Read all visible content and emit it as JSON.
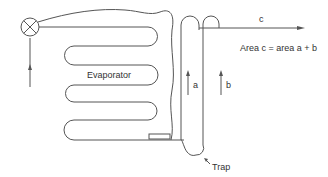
{
  "diagram": {
    "type": "refrigeration-evaporator-schematic",
    "labels": {
      "evaporator": "Evaporator",
      "flow_a": "a",
      "flow_b": "b",
      "flow_c": "c",
      "equation": "Area c = area a + b",
      "trap": "Trap"
    },
    "components": [
      {
        "name": "expansion-valve",
        "symbol": "circle-with-x"
      },
      {
        "name": "evaporator-coil",
        "shape": "serpentine"
      },
      {
        "name": "suction-riser-a"
      },
      {
        "name": "suction-riser-b"
      },
      {
        "name": "trap"
      },
      {
        "name": "suction-outlet-c"
      }
    ],
    "colors": {
      "line": "#555555",
      "text": "#333333",
      "background": "#ffffff"
    }
  }
}
